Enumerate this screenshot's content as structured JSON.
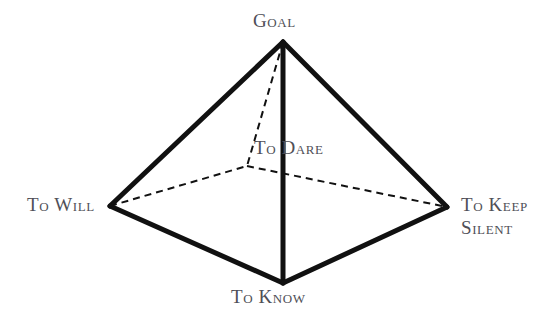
{
  "diagram": {
    "type": "pyramid",
    "background_color": "#ffffff",
    "line_color": "#111111",
    "text_color": "#4f4f57",
    "solid_line_width": 5,
    "dashed_line_width": 2,
    "dash_pattern": "7 5",
    "vertices": [
      {
        "id": "apex",
        "label": "Goal",
        "x": 283,
        "y": 42,
        "hidden": false
      },
      {
        "id": "left",
        "label": "To Will",
        "x": 110,
        "y": 206,
        "hidden": false
      },
      {
        "id": "right",
        "label": "To Keep Silent",
        "x": 447,
        "y": 207,
        "hidden": false
      },
      {
        "id": "front",
        "label": "To Know",
        "x": 283,
        "y": 283,
        "hidden": false
      },
      {
        "id": "back",
        "label": "",
        "x": 247,
        "y": 166,
        "hidden": true
      }
    ],
    "edges": [
      {
        "from": "apex",
        "to": "left",
        "style": "solid"
      },
      {
        "from": "apex",
        "to": "right",
        "style": "solid"
      },
      {
        "from": "apex",
        "to": "front",
        "style": "solid"
      },
      {
        "from": "left",
        "to": "front",
        "style": "solid"
      },
      {
        "from": "right",
        "to": "front",
        "style": "solid"
      },
      {
        "from": "apex",
        "to": "back",
        "style": "dashed"
      },
      {
        "from": "left",
        "to": "back",
        "style": "dashed"
      },
      {
        "from": "back",
        "to": "right",
        "style": "dashed"
      }
    ],
    "labels": {
      "goal": "Goal",
      "to_will": "To Will",
      "to_keep_silent_line1": "To Keep",
      "to_keep_silent_line2": "Silent",
      "to_know": "To Know",
      "to_dare": "To Dare"
    }
  }
}
